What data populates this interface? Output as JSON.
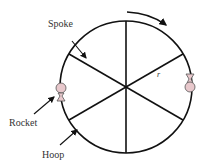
{
  "diagram": {
    "type": "rotating-hoop-with-spokes",
    "labels": {
      "spoke": "Spoke",
      "rocket": "Rocket",
      "hoop": "Hoop",
      "radius": "r"
    },
    "spoke_count": 6,
    "rocket_count": 2,
    "rotation_direction": "clockwise",
    "colors": {
      "line": "#111111",
      "rocket_fill": "#e8c8cc",
      "rocket_stroke": "#555555"
    }
  }
}
